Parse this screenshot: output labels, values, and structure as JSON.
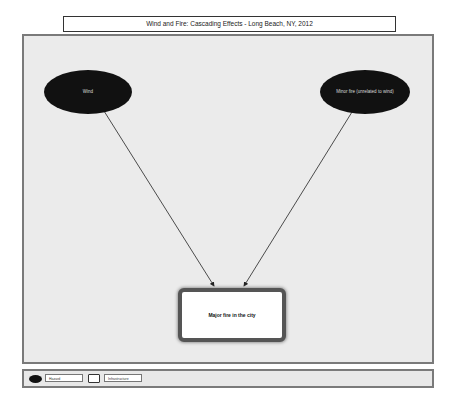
{
  "title": "Wind and Fire: Cascading Effects - Long Beach, NY, 2012",
  "nodes": {
    "wind": {
      "label": "Wind",
      "type": "hazard"
    },
    "minor_fire": {
      "label": "Minor fire (unrelated to wind)",
      "type": "hazard"
    },
    "major_fire": {
      "label": "Major fire in the city",
      "type": "infrastructure"
    }
  },
  "edges": [
    {
      "from": "wind",
      "to": "major_fire"
    },
    {
      "from": "minor_fire",
      "to": "major_fire"
    }
  ],
  "legend": {
    "hazard": "Hazard",
    "infrastructure": "Infrastructure"
  },
  "colors": {
    "hazard_fill": "#111111",
    "panel_bg": "#ebebeb",
    "border": "#7a7a7a"
  }
}
